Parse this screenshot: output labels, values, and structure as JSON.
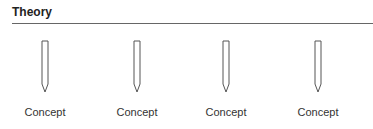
{
  "title": "Theory",
  "concepts": [
    {
      "label": "Concept",
      "x": 45
    },
    {
      "label": "Concept",
      "x": 137
    },
    {
      "label": "Concept",
      "x": 226
    },
    {
      "label": "Concept",
      "x": 318
    }
  ],
  "colors": {
    "line": "#666666",
    "arrow_stroke": "#555555"
  }
}
